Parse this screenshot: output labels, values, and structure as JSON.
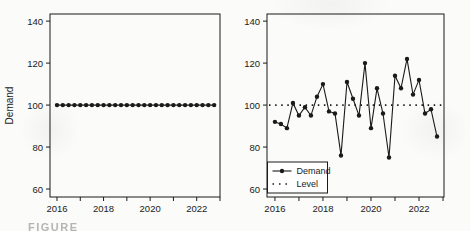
{
  "figure": {
    "caption_fragment": "FIGURE",
    "colors": {
      "line": "#1a1a1a",
      "axis": "#1a1a1a",
      "text": "#1a1a1a",
      "background": "#fbfbf9",
      "caption": "#9d9d98"
    }
  },
  "chart_data": [
    {
      "type": "line",
      "panel": "left",
      "title": "",
      "xlabel": "",
      "ylabel": "Demand",
      "x_start": 2016,
      "x_step": 0.25,
      "x_tick_values": [
        2016,
        2018,
        2020,
        2022
      ],
      "x_tick_labels": [
        "2016",
        "2018",
        "2020",
        "2022"
      ],
      "x_minor_tick_values": [
        2017,
        2019,
        2021,
        2023
      ],
      "y_tick_values": [
        60,
        80,
        100,
        120,
        140
      ],
      "y_tick_labels": [
        "60",
        "80",
        "100",
        "120",
        "140"
      ],
      "xlim": [
        2015.7,
        2023.0
      ],
      "ylim": [
        56.2,
        143.4
      ],
      "grid": false,
      "legend": null,
      "series": [
        {
          "name": "Demand",
          "style": "solid_with_markers",
          "values": [
            100,
            100,
            100,
            100,
            100,
            100,
            100,
            100,
            100,
            100,
            100,
            100,
            100,
            100,
            100,
            100,
            100,
            100,
            100,
            100,
            100,
            100,
            100,
            100,
            100,
            100,
            100,
            100
          ]
        }
      ]
    },
    {
      "type": "line",
      "panel": "right",
      "title": "",
      "xlabel": "",
      "ylabel": "",
      "x_start": 2016,
      "x_step": 0.25,
      "x_tick_values": [
        2016,
        2018,
        2020,
        2022
      ],
      "x_tick_labels": [
        "2016",
        "2018",
        "2020",
        "2022"
      ],
      "x_minor_tick_values": [
        2017,
        2019,
        2021,
        2023
      ],
      "y_tick_values": [
        60,
        80,
        100,
        120,
        140
      ],
      "y_tick_labels": [
        "60",
        "80",
        "100",
        "120",
        "140"
      ],
      "xlim": [
        2015.67,
        2023.04
      ],
      "ylim": [
        56.2,
        143.4
      ],
      "grid": false,
      "legend": {
        "position": "bottom-left",
        "entries": [
          {
            "label": "Demand",
            "style": "solid_with_markers"
          },
          {
            "label": "Level",
            "style": "dotted"
          }
        ]
      },
      "series": [
        {
          "name": "Demand",
          "style": "solid_with_markers",
          "values": [
            92,
            91,
            89,
            101,
            95,
            99,
            95,
            104,
            110,
            97,
            96,
            76,
            111,
            103,
            95,
            120,
            89,
            108,
            96,
            75,
            114,
            108,
            122,
            105,
            112,
            96,
            98,
            85
          ]
        },
        {
          "name": "Level",
          "style": "dotted",
          "constant": 100
        }
      ]
    }
  ]
}
